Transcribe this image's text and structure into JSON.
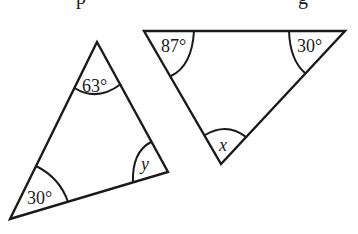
{
  "header": {
    "clipped_text_glyphs": [
      {
        "char": "p",
        "x": 76
      },
      {
        "char": "g",
        "x": 298
      }
    ]
  },
  "triangles": [
    {
      "id": "left",
      "vertices": {
        "top": [
          97,
          42
        ],
        "bottom_left": [
          10,
          219
        ],
        "right": [
          168,
          172
        ]
      },
      "angles": {
        "top": "63°",
        "bottom_left": "30°",
        "right": "y"
      }
    },
    {
      "id": "right",
      "vertices": {
        "top_left": [
          144,
          31
        ],
        "top_right": [
          345,
          31
        ],
        "bottom": [
          221,
          164
        ]
      },
      "angles": {
        "top_left": "87°",
        "top_right": "30°",
        "bottom": "x"
      }
    }
  ],
  "labels": {
    "left_top": "63°",
    "left_bottom_left": "30°",
    "left_right": "y",
    "right_top_left": "87°",
    "right_top_right": "30°",
    "right_bottom": "x"
  },
  "colors": {
    "stroke": "#1a1a1a",
    "background": "#ffffff"
  }
}
